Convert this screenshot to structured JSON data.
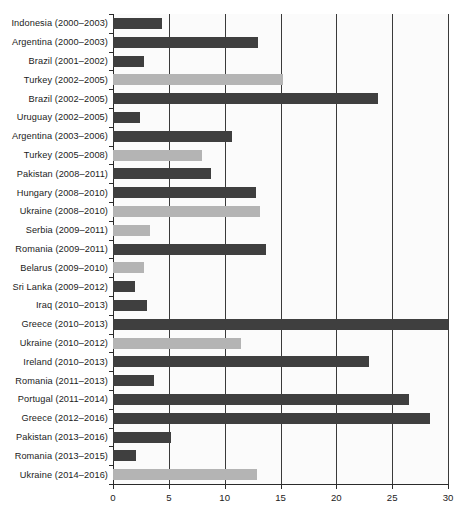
{
  "figure": {
    "caption_faint": "",
    "background_color": "#ffffff",
    "plot_background_color": "#fbfbfb"
  },
  "colors": {
    "series_dark": "#3f3f3f",
    "series_light": "#b4b4b4",
    "axis": "#2a2a2a",
    "gridline": "#3a3a3a",
    "text": "#1b1b1b"
  },
  "axis": {
    "x_ticks": [
      "0",
      "5",
      "10",
      "15",
      "20",
      "25",
      "30"
    ],
    "x_min": 0,
    "x_max": 30
  },
  "chart_data": {
    "type": "bar",
    "orientation": "horizontal",
    "title": "",
    "subtitle": "",
    "xlabel": "",
    "ylabel": "",
    "xlim": [
      0,
      30
    ],
    "xticks": [
      0,
      5,
      10,
      15,
      20,
      25,
      30
    ],
    "grid": "vertical",
    "legend": [],
    "legend_position": "none",
    "categories": [
      "Indonesia (2000–2003)",
      "Argentina (2000–2003)",
      "Brazil (2001–2002)",
      "Turkey (2002–2005)",
      "Brazil (2002–2005)",
      "Uruguay (2002–2005)",
      "Argentina (2003–2006)",
      "Turkey (2005–2008)",
      "Pakistan (2008–2011)",
      "Hungary (2008–2010)",
      "Ukraine (2008–2010)",
      "Serbia (2009–2011)",
      "Romania (2009–2011)",
      "Belarus (2009–2010)",
      "Sri Lanka (2009–2012)",
      "Iraq (2010–2013)",
      "Greece (2010–2013)",
      "Ukraine (2010–2012)",
      "Ireland (2010–2013)",
      "Romania (2011–2013)",
      "Portugal (2011–2014)",
      "Greece (2012–2016)",
      "Pakistan (2013–2016)",
      "Romania (2013–2015)",
      "Ukraine (2014–2016)"
    ],
    "values": [
      4.4,
      13.0,
      2.8,
      15.2,
      23.7,
      2.4,
      10.7,
      8.0,
      8.8,
      12.8,
      13.2,
      3.3,
      13.7,
      2.8,
      2.0,
      3.0,
      30.0,
      11.5,
      22.9,
      3.7,
      26.5,
      28.4,
      5.2,
      2.1,
      12.9
    ],
    "shades": [
      "dark",
      "dark",
      "dark",
      "light",
      "dark",
      "dark",
      "dark",
      "light",
      "dark",
      "dark",
      "light",
      "light",
      "dark",
      "light",
      "dark",
      "dark",
      "dark",
      "light",
      "dark",
      "dark",
      "dark",
      "dark",
      "dark",
      "dark",
      "light"
    ]
  }
}
